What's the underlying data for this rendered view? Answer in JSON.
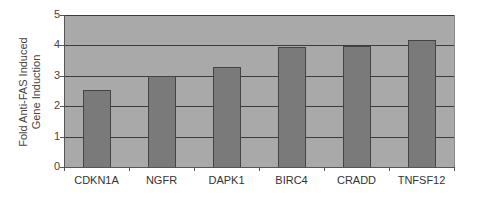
{
  "chart_data": {
    "type": "bar",
    "title": "",
    "xlabel": "",
    "ylabel": "Fold Anti-FAS Induced Gene Induction",
    "ylabel_lines": [
      "Fold Anti-FAS Induced",
      "Gene Induction"
    ],
    "categories": [
      "CDKN1A",
      "NGFR",
      "DAPK1",
      "BIRC4",
      "CRADD",
      "TNFSF12"
    ],
    "values": [
      2.53,
      3.0,
      3.29,
      3.95,
      3.98,
      4.17
    ],
    "ylim": [
      0,
      5
    ],
    "yticks": [
      "0",
      "1",
      "2",
      "3",
      "4",
      "5"
    ],
    "grid": true,
    "legend": null,
    "colors": {
      "bar": "#7a7a7a",
      "bar_border": "#444444",
      "plot_background": "#a9a9a9",
      "gridline": "#3c3c3c",
      "axis": "#555555"
    }
  }
}
